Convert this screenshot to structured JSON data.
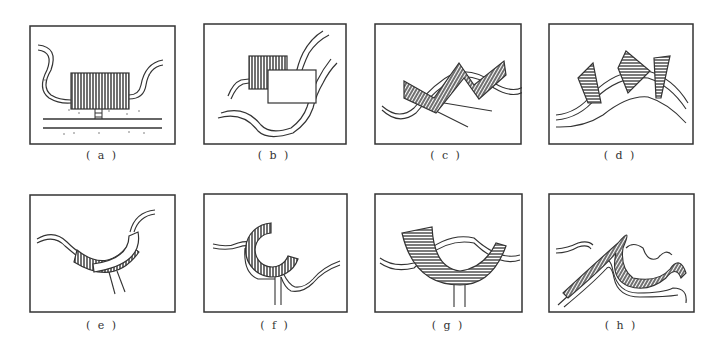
{
  "figure": {
    "panels": [
      {
        "id": "a",
        "label": "( a )",
        "description": "rectangular hatched building on stilts between two curving roads, straight road below"
      },
      {
        "id": "b",
        "label": "( b )",
        "description": "hatched block with adjoining plain rectangle in a curving valley"
      },
      {
        "id": "c",
        "label": "( c )",
        "description": "zigzag hatched building following hillside contours"
      },
      {
        "id": "d",
        "label": "( d )",
        "description": "three tilted trapezoidal hatched blocks along a ridge"
      },
      {
        "id": "e",
        "label": "( e )",
        "description": "curved hatched arc building in a valley with bridge access"
      },
      {
        "id": "f",
        "label": "( f )",
        "description": "C-shaped hatched ring building at a road bend"
      },
      {
        "id": "g",
        "label": "( g )",
        "description": "large U-shaped hatched arc on stilts over a wavy road"
      },
      {
        "id": "h",
        "label": "( h )",
        "description": "flowing hatched band following undulating terrain"
      }
    ],
    "colors": {
      "ink": "#3a3a3a",
      "background": "#ffffff"
    }
  }
}
